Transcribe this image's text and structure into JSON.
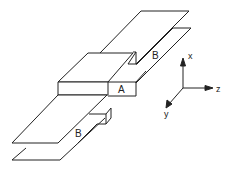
{
  "diagram": {
    "labels": {
      "block": "A",
      "plate_upper": "B",
      "plate_lower": "B"
    },
    "axes": {
      "x": "x",
      "y": "y",
      "z": "z"
    },
    "colors": {
      "line": "#222222",
      "background": "#ffffff"
    }
  }
}
